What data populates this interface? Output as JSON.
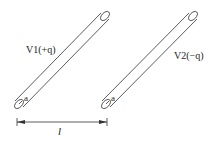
{
  "diagram": {
    "conductors": [
      {
        "name": "V1",
        "potential_label": "V1",
        "charge_label": "(+q)",
        "radius_label": "a"
      },
      {
        "name": "V2",
        "potential_label": "V2",
        "charge_label": "(−q)",
        "radius_label": "a"
      }
    ],
    "separation_label": "l",
    "colors": {
      "stroke": "#333333",
      "background": "#ffffff"
    }
  }
}
